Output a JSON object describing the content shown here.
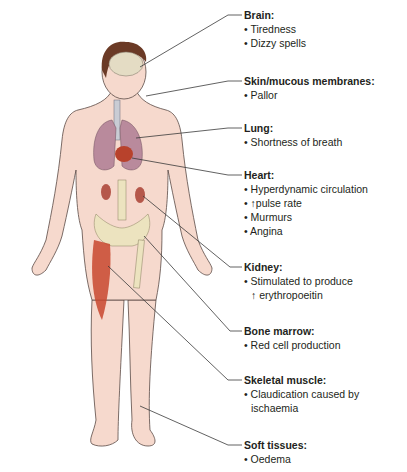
{
  "figure": {
    "type": "anatomical-diagram",
    "colors": {
      "skin": "#f6d9cd",
      "skin_outline": "#5a4a45",
      "hair": "#6b3a26",
      "brain": "#e4dcc4",
      "lung": "#b98a9c",
      "heart": "#b8422c",
      "kidney": "#b5574a",
      "bone": "#ece3bf",
      "muscle": "#c8462e",
      "leader_line": "#3a3a3a",
      "text": "#231f20"
    }
  },
  "callouts": [
    {
      "id": "brain",
      "title": "Brain:",
      "items": [
        "• Tiredness",
        "• Dizzy spells"
      ]
    },
    {
      "id": "skin",
      "title": "Skin/mucous membranes:",
      "items": [
        "• Pallor"
      ]
    },
    {
      "id": "lung",
      "title": "Lung:",
      "items": [
        "•  Shortness of breath"
      ]
    },
    {
      "id": "heart",
      "title": "Heart:",
      "items": [
        "• Hyperdynamic circulation",
        "• ↑pulse rate",
        "• Murmurs",
        "• Angina"
      ]
    },
    {
      "id": "kidney",
      "title": "Kidney:",
      "items": [
        "• Stimulated to produce",
        "↑ erythropoeitin"
      ]
    },
    {
      "id": "bone_marrow",
      "title": "Bone marrow:",
      "items": [
        "• Red cell production"
      ]
    },
    {
      "id": "skeletal_muscle",
      "title": "Skeletal muscle:",
      "items": [
        "• Claudication caused by",
        "ischaemia"
      ]
    },
    {
      "id": "soft_tissues",
      "title": "Soft tissues:",
      "items": [
        "• Oedema"
      ]
    }
  ]
}
